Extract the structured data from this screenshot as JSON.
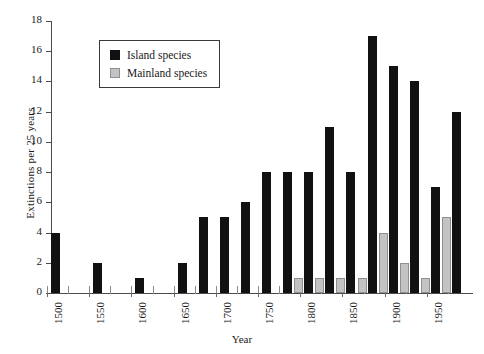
{
  "chart_data": {
    "type": "bar",
    "title": "",
    "xlabel": "Year",
    "ylabel": "Extinctions per 25 years",
    "ylim": [
      0,
      18
    ],
    "ytick_step": 2,
    "yticks": [
      0,
      2,
      4,
      6,
      8,
      10,
      12,
      14,
      16,
      18
    ],
    "xlim": [
      1500,
      2000
    ],
    "xtick_labels": [
      "1500",
      "1550",
      "1600",
      "1650",
      "1700",
      "1750",
      "1800",
      "1850",
      "1900",
      "1950"
    ],
    "xtick_values": [
      1500,
      1550,
      1600,
      1650,
      1700,
      1750,
      1800,
      1850,
      1900,
      1950
    ],
    "grid": false,
    "legend_position": "upper-left-inset",
    "categories": [
      1500,
      1525,
      1550,
      1575,
      1600,
      1625,
      1650,
      1675,
      1700,
      1725,
      1750,
      1775,
      1800,
      1825,
      1850,
      1875,
      1900,
      1925,
      1950,
      1975
    ],
    "series": [
      {
        "name": "Island species",
        "color": "#111111",
        "values": [
          4,
          0,
          2,
          0,
          1,
          0,
          2,
          5,
          5,
          6,
          8,
          8,
          8,
          11,
          8,
          17,
          15,
          14,
          7,
          12
        ]
      },
      {
        "name": "Mainland species",
        "color": "#c3c3c3",
        "values": [
          0,
          0,
          0,
          0,
          0,
          0,
          0,
          0,
          0,
          0,
          0,
          0,
          1,
          1,
          1,
          1,
          4,
          2,
          1,
          5
        ]
      }
    ]
  },
  "legend": {
    "items": [
      {
        "label": "Island species",
        "swatch": "black"
      },
      {
        "label": "Mainland species",
        "swatch": "gray"
      }
    ]
  },
  "axes": {
    "y_title": "Extinctions per 25 years",
    "x_title": "Year"
  }
}
